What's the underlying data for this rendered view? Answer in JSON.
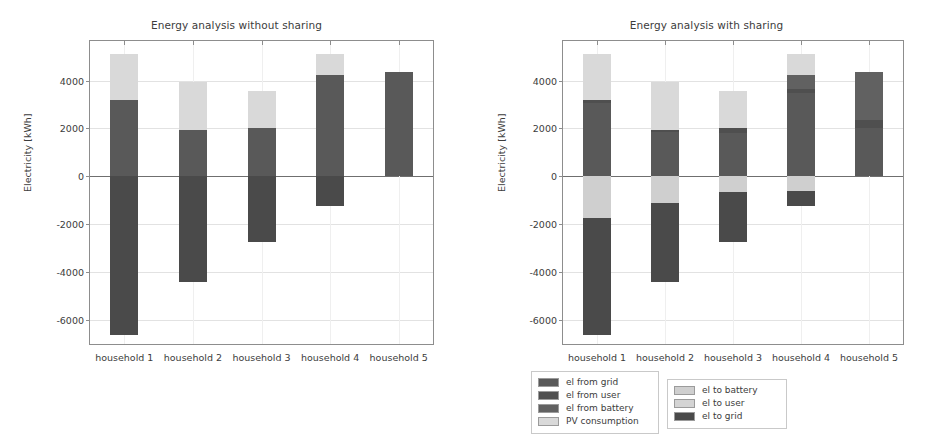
{
  "figure": {
    "width": 947,
    "height": 445,
    "background": "#ffffff"
  },
  "colors": {
    "el_from_grid": "#595959",
    "el_from_user": "#4f4f4f",
    "el_from_battery": "#616161",
    "pv_consumption": "#d9d9d9",
    "el_to_battery": "#cfcfcf",
    "el_to_user": "#d4d4d4",
    "el_to_grid": "#4a4a4a",
    "axis": "#8d8d8d",
    "grid": "#e2e2e2",
    "zero_line": "#6f6f6f",
    "text": "#3c3c3c"
  },
  "axes": {
    "ylabel": "Electricity [kWh]",
    "yticks": [
      4000,
      2000,
      0,
      -2000,
      -4000,
      -6000
    ],
    "ytick_labels": [
      "4000",
      "2000",
      "0",
      "-2000",
      "-4000",
      "-6000"
    ],
    "ylim": [
      -7000,
      5650
    ],
    "categories": [
      "household 1",
      "household 2",
      "household 3",
      "household 4",
      "household 5"
    ],
    "grid": true
  },
  "legend": {
    "position": "below-center",
    "boxes": [
      {
        "name": "from-legend",
        "entries": [
          {
            "label": "el from grid",
            "color_key": "el_from_grid"
          },
          {
            "label": "el from user",
            "color_key": "el_from_user"
          },
          {
            "label": "el from battery",
            "color_key": "el_from_battery"
          },
          {
            "label": "PV consumption",
            "color_key": "pv_consumption"
          }
        ]
      },
      {
        "name": "to-legend",
        "entries": [
          {
            "label": "el to battery",
            "color_key": "el_to_battery"
          },
          {
            "label": "el to user",
            "color_key": "el_to_user"
          },
          {
            "label": "el to grid",
            "color_key": "el_to_grid"
          }
        ]
      }
    ]
  },
  "chart_data": [
    {
      "type": "bar",
      "stacked": true,
      "name": "without-sharing",
      "title": "Energy analysis without sharing",
      "xlabel": "",
      "ylabel": "Electricity [kWh]",
      "ylim": [
        -7000,
        5650
      ],
      "categories": [
        "household 1",
        "household 2",
        "household 3",
        "household 4",
        "household 5"
      ],
      "series": [
        {
          "name": "el from grid",
          "color_key": "el_from_grid",
          "values": [
            3180,
            1950,
            2000,
            4230,
            4370
          ]
        },
        {
          "name": "el from user",
          "color_key": "el_from_user",
          "values": [
            0,
            0,
            0,
            0,
            0
          ]
        },
        {
          "name": "el from battery",
          "color_key": "el_from_battery",
          "values": [
            0,
            0,
            0,
            0,
            0
          ]
        },
        {
          "name": "PV consumption",
          "color_key": "pv_consumption",
          "values": [
            1930,
            2000,
            1550,
            880,
            0
          ]
        },
        {
          "name": "el to battery",
          "color_key": "el_to_battery",
          "values": [
            0,
            0,
            0,
            0,
            0
          ]
        },
        {
          "name": "el to user",
          "color_key": "el_to_user",
          "values": [
            0,
            0,
            0,
            0,
            0
          ]
        },
        {
          "name": "el to grid",
          "color_key": "el_to_grid",
          "values": [
            -6630,
            -4400,
            -2750,
            -1250,
            0
          ]
        }
      ],
      "totals_positive": [
        5110,
        3950,
        3550,
        5110,
        4370
      ],
      "totals_negative": [
        -6630,
        -4400,
        -2750,
        -1250,
        0
      ]
    },
    {
      "type": "bar",
      "stacked": true,
      "name": "with-sharing",
      "title": "Energy analysis with sharing",
      "xlabel": "",
      "ylabel": "Electricity [kWh]",
      "ylim": [
        -7000,
        5650
      ],
      "categories": [
        "household 1",
        "household 2",
        "household 3",
        "household 4",
        "household 5"
      ],
      "series": [
        {
          "name": "el from grid",
          "color_key": "el_from_grid",
          "values": [
            3050,
            1850,
            1800,
            3460,
            2000
          ]
        },
        {
          "name": "el from user",
          "color_key": "el_from_user",
          "values": [
            130,
            100,
            200,
            170,
            370
          ]
        },
        {
          "name": "el from battery",
          "color_key": "el_from_battery",
          "values": [
            0,
            0,
            0,
            600,
            2000
          ]
        },
        {
          "name": "PV consumption",
          "color_key": "pv_consumption",
          "values": [
            1930,
            2000,
            1550,
            880,
            0
          ]
        },
        {
          "name": "el to battery",
          "color_key": "el_to_battery",
          "values": [
            -1750,
            -1100,
            -650,
            -600,
            0
          ]
        },
        {
          "name": "el to user",
          "color_key": "el_to_user",
          "values": [
            0,
            0,
            0,
            0,
            0
          ]
        },
        {
          "name": "el to grid",
          "color_key": "el_to_grid",
          "values": [
            -4880,
            -3300,
            -2100,
            -650,
            0
          ]
        }
      ],
      "totals_positive": [
        5110,
        3950,
        3550,
        5110,
        4370
      ],
      "totals_negative": [
        -6630,
        -4400,
        -2750,
        -1250,
        0
      ]
    }
  ]
}
